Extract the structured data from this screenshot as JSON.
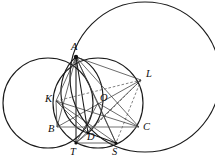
{
  "figure": {
    "canvas": {
      "width": 215,
      "height": 165
    },
    "colors": {
      "background": "#ffffff",
      "stroke_circle": "#1a1a1a",
      "stroke_chord": "#3a3a3a",
      "stroke_dashed": "#4a4a4a",
      "stroke_gray": "#6d6d6d",
      "point": "#111111",
      "label": "#0d0d0d"
    },
    "points": [
      {
        "id": "A",
        "label": "A",
        "x": 76,
        "y": 57,
        "label_x": 71,
        "label_y": 50,
        "dot": true
      },
      {
        "id": "L",
        "label": "L",
        "x": 141,
        "y": 80,
        "label_x": 146,
        "label_y": 77,
        "dot": false
      },
      {
        "id": "K",
        "label": "K",
        "x": 56,
        "y": 101,
        "label_x": 45,
        "label_y": 102,
        "dot": false
      },
      {
        "id": "O",
        "label": "O",
        "x": 98,
        "y": 103,
        "label_x": 100,
        "label_y": 101,
        "dot": false
      },
      {
        "id": "B",
        "label": "B",
        "x": 57,
        "y": 127,
        "label_x": 48,
        "label_y": 132,
        "dot": false
      },
      {
        "id": "C",
        "label": "C",
        "x": 139,
        "y": 127,
        "label_x": 143,
        "label_y": 130,
        "dot": false
      },
      {
        "id": "D",
        "label": "D",
        "x": 88,
        "y": 133,
        "label_x": 87,
        "label_y": 140,
        "dot": true
      },
      {
        "id": "T",
        "label": "T",
        "x": 76,
        "y": 143,
        "label_x": 70,
        "label_y": 155,
        "dot": true
      },
      {
        "id": "S",
        "label": "S",
        "x": 116,
        "y": 143,
        "label_x": 112,
        "label_y": 155,
        "dot": true
      }
    ],
    "circles": [
      {
        "id": "circle-large-right",
        "cx": 145,
        "cy": 77,
        "r": 75
      },
      {
        "id": "circle-left",
        "cx": 48,
        "cy": 103,
        "r": 45
      },
      {
        "id": "circle-main",
        "cx": 98,
        "cy": 103,
        "r": 45
      }
    ],
    "arcs": [
      {
        "id": "arc-lens-left",
        "from": "A",
        "to": "D",
        "rx": 34,
        "ry": 42,
        "sweep": 0
      },
      {
        "id": "arc-lens-right",
        "from": "A",
        "to": "D",
        "rx": 34,
        "ry": 42,
        "sweep": 1
      }
    ],
    "segments": [
      {
        "id": "seg-A-T",
        "from": "A",
        "to": "T",
        "style": "strong"
      },
      {
        "id": "seg-A-D",
        "from": "A",
        "to": "D",
        "style": "strong"
      },
      {
        "id": "seg-A-S",
        "from": "A",
        "to": "S",
        "style": "plain"
      },
      {
        "id": "seg-A-C",
        "from": "A",
        "to": "C",
        "style": "plain"
      },
      {
        "id": "seg-A-B",
        "from": "A",
        "to": "B",
        "style": "plain"
      },
      {
        "id": "seg-A-K",
        "from": "A",
        "to": "K",
        "style": "plain"
      },
      {
        "id": "seg-A-L",
        "from": "A",
        "to": "L",
        "style": "plain"
      },
      {
        "id": "seg-A-O",
        "from": "A",
        "to": "O",
        "style": "plain"
      },
      {
        "id": "seg-K-L",
        "from": "K",
        "to": "L",
        "style": "dashed"
      },
      {
        "id": "seg-K-S",
        "from": "K",
        "to": "S",
        "style": "plain"
      },
      {
        "id": "seg-K-C",
        "from": "K",
        "to": "C",
        "style": "plain"
      },
      {
        "id": "seg-K-D",
        "from": "K",
        "to": "D",
        "style": "plain"
      },
      {
        "id": "seg-L-T",
        "from": "L",
        "to": "T",
        "style": "plain"
      },
      {
        "id": "seg-L-D",
        "from": "L",
        "to": "D",
        "style": "dashed"
      },
      {
        "id": "seg-L-S",
        "from": "L",
        "to": "S",
        "style": "dashed"
      },
      {
        "id": "seg-L-B",
        "from": "L",
        "to": "B",
        "style": "plain"
      },
      {
        "id": "seg-B-C",
        "from": "B",
        "to": "C",
        "style": "gray"
      },
      {
        "id": "seg-T-S",
        "from": "T",
        "to": "S",
        "style": "plain"
      },
      {
        "id": "seg-D-S",
        "from": "D",
        "to": "S",
        "style": "strong"
      },
      {
        "id": "seg-T-D",
        "from": "T",
        "to": "D",
        "style": "plain"
      },
      {
        "id": "seg-K-B",
        "from": "K",
        "to": "B",
        "style": "plain"
      },
      {
        "id": "seg-O-S",
        "from": "O",
        "to": "S",
        "style": "plain"
      },
      {
        "id": "seg-O-T",
        "from": "O",
        "to": "T",
        "style": "plain"
      },
      {
        "id": "seg-O-C",
        "from": "O",
        "to": "C",
        "style": "plain"
      }
    ]
  }
}
